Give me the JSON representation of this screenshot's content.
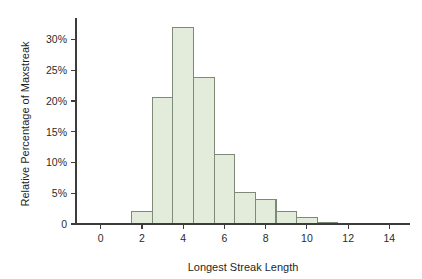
{
  "figure": {
    "background_color": "#ffffff",
    "axis_color": "#3c3c3c"
  },
  "chart_data": {
    "type": "bar",
    "title": "",
    "xlabel": "Longest Streak Length",
    "ylabel": "Relative Percentage of Maxstreak",
    "xlim": [
      -1.2,
      15.0
    ],
    "ylim": [
      0,
      33.5
    ],
    "grid": false,
    "legend": "none",
    "bar_fill_color": "#e3ebdb",
    "bar_edge_color": "#7d8a78",
    "bin_width": 1,
    "bin_offset": 0.5,
    "x_ticks": [
      0,
      2,
      4,
      6,
      8,
      10,
      12,
      14
    ],
    "x_tick_labels": [
      "0",
      "2",
      "4",
      "6",
      "8",
      "10",
      "12",
      "14"
    ],
    "y_ticks": [
      0,
      5,
      10,
      15,
      20,
      25,
      30
    ],
    "y_tick_labels": [
      "0",
      "5%",
      "10%",
      "15%",
      "20%",
      "25%",
      "30%"
    ],
    "bins": [
      {
        "start": 1.5,
        "end": 2.5,
        "center": 2,
        "value": 2.0
      },
      {
        "start": 2.5,
        "end": 3.5,
        "center": 3,
        "value": 20.5
      },
      {
        "start": 3.5,
        "end": 4.5,
        "center": 4,
        "value": 32.0
      },
      {
        "start": 4.5,
        "end": 5.5,
        "center": 5,
        "value": 23.8
      },
      {
        "start": 5.5,
        "end": 6.5,
        "center": 6,
        "value": 11.3
      },
      {
        "start": 6.5,
        "end": 7.5,
        "center": 7,
        "value": 5.1
      },
      {
        "start": 7.5,
        "end": 8.5,
        "center": 8,
        "value": 4.0
      },
      {
        "start": 8.5,
        "end": 9.5,
        "center": 9,
        "value": 2.0
      },
      {
        "start": 9.5,
        "end": 10.5,
        "center": 10,
        "value": 1.0
      },
      {
        "start": 10.5,
        "end": 11.5,
        "center": 11,
        "value": 0.2
      }
    ],
    "categories": [
      "2",
      "3",
      "4",
      "5",
      "6",
      "7",
      "8",
      "9",
      "10",
      "11"
    ],
    "values": [
      2.0,
      20.5,
      32.0,
      23.8,
      11.3,
      5.1,
      4.0,
      2.0,
      1.0,
      0.2
    ]
  }
}
